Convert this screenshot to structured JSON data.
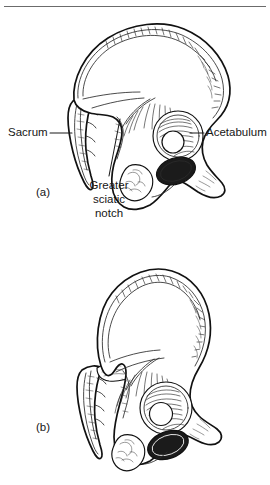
{
  "figure": {
    "kind": "anatomical-line-drawing",
    "background_color": "#ffffff",
    "ink_color": "#111111",
    "text_color": "#161616",
    "top_rule": true
  },
  "panels": [
    {
      "id": "a",
      "label": "(a)",
      "description": "Female hip bone and sacrum, lateral view with annotations"
    },
    {
      "id": "b",
      "label": "(b)",
      "description": "Male hip bone and sacrum, lateral view, unannotated"
    }
  ],
  "annotations": [
    {
      "id": "sacrum",
      "label": "Sacrum",
      "lines": [
        "Sacrum"
      ],
      "side": "left",
      "leader": true
    },
    {
      "id": "acetabulum",
      "label": "Acetabulum",
      "lines": [
        "Acetabulum"
      ],
      "side": "right",
      "leader": true
    },
    {
      "id": "greater-sciatic-notch",
      "label": "Greater sciatic notch",
      "lines": [
        "Greater",
        "sciatic",
        "notch"
      ],
      "side": "below",
      "leader": true
    }
  ],
  "labels": {
    "sacrum": "Sacrum",
    "acetabulum": "Acetabulum",
    "notch_line_1": "Greater",
    "notch_line_2": "sciatic",
    "notch_line_3": "notch",
    "panel_a": "(a)",
    "panel_b": "(b)"
  }
}
